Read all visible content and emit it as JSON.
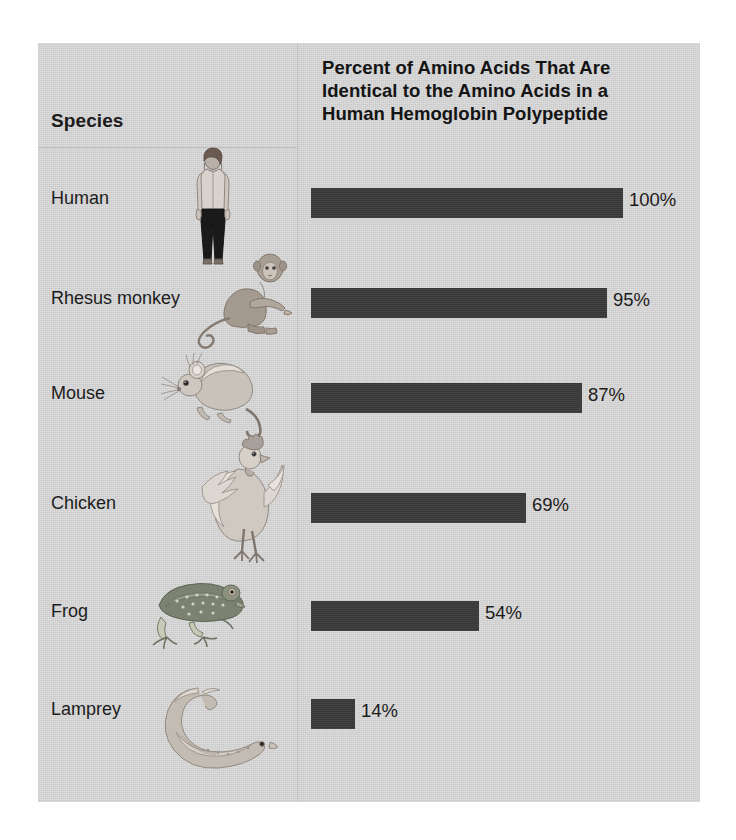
{
  "figure": {
    "species_column_header": "Species",
    "title_lines": [
      "Percent of Amino Acids That Are",
      "Identical to the Amino Acids in a",
      "Human Hemoglobin Polypeptide"
    ],
    "title_full": "Percent of Amino Acids That Are Identical to the Amino Acids in a Human Hemoglobin Polypeptide",
    "panel_color": "#d2d2d2",
    "bar_color": "#3b3b3b",
    "text_color": "#1c1c1c"
  },
  "rows": [
    {
      "species": "Human",
      "value": 100,
      "label": "100%",
      "art": "human-figure-illustration"
    },
    {
      "species": "Rhesus monkey",
      "value": 95,
      "label": "95%",
      "art": "rhesus-monkey-illustration"
    },
    {
      "species": "Mouse",
      "value": 87,
      "label": "87%",
      "art": "mouse-illustration"
    },
    {
      "species": "Chicken",
      "value": 69,
      "label": "69%",
      "art": "chicken-rooster-illustration"
    },
    {
      "species": "Frog",
      "value": 54,
      "label": "54%",
      "art": "frog-illustration"
    },
    {
      "species": "Lamprey",
      "value": 14,
      "label": "14%",
      "art": "lamprey-illustration"
    }
  ],
  "chart_data": {
    "type": "bar",
    "orientation": "horizontal",
    "title": "Percent of Amino Acids That Are Identical to the Amino Acids in a Human Hemoglobin Polypeptide",
    "subtitle": "",
    "xlabel": "Percent of Amino Acids That Are Identical to the Amino Acids in a Human Hemoglobin Polypeptide",
    "ylabel": "Species",
    "categories": [
      "Human",
      "Rhesus monkey",
      "Mouse",
      "Chicken",
      "Frog",
      "Lamprey"
    ],
    "values": [
      100,
      95,
      87,
      69,
      54,
      14
    ],
    "data_labels": [
      "100%",
      "95%",
      "87%",
      "69%",
      "54%",
      "14%"
    ],
    "xlim": [
      0,
      100
    ],
    "grid": false,
    "legend": null,
    "axis_ticks_shown": false,
    "units": "percent"
  }
}
